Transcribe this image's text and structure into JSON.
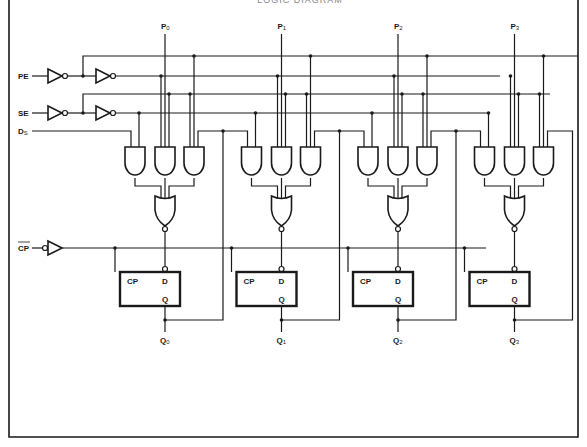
{
  "title": "LOGIC DIAGRAM",
  "inputs": {
    "pe": "PE",
    "se": "SE",
    "ds": {
      "main": "D",
      "sub": "S"
    },
    "cp": "CP"
  },
  "parallel_inputs": [
    {
      "main": "P",
      "sub": "0"
    },
    {
      "main": "P",
      "sub": "1"
    },
    {
      "main": "P",
      "sub": "2"
    },
    {
      "main": "P",
      "sub": "3"
    }
  ],
  "outputs": [
    {
      "main": "Q",
      "sub": "0"
    },
    {
      "main": "Q",
      "sub": "1"
    },
    {
      "main": "Q",
      "sub": "2"
    },
    {
      "main": "Q",
      "sub": "3"
    }
  ],
  "flipflop": {
    "clock_pin": "CP",
    "data_pin": "D",
    "output_pin": "Q"
  },
  "cell_count": 4,
  "colors": {
    "ink": "#1a1a1a",
    "background": "#ffffff"
  }
}
